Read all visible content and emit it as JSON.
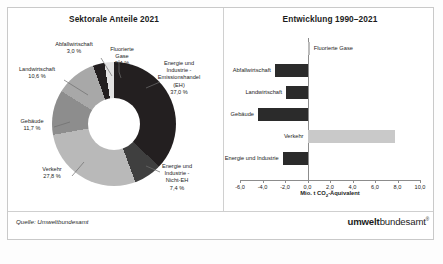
{
  "figure": {
    "source_note": "Quelle: Umweltbundesamt",
    "logo_bold": "umwelt",
    "logo_rest": "bundesamt",
    "logo_mark": "®"
  },
  "left_panel": {
    "title": "Sektorale Anteile 2021",
    "labels": {
      "abfall": "Abfallwirtschaft\n3,0 %",
      "fluor": "Fluorierte\nGase\n2,4 %",
      "eh": "Energie und\nIndustrie -\nEmissionshandel\n(EH)\n37,0 %",
      "nicht_eh": "Energie und\nIndustrie -\nNicht-EH\n7,4 %",
      "verkehr": "Verkehr\n27,8 %",
      "gebaeude": "Gebäude\n11,7 %",
      "landwirtschaft": "Landwirtschaft\n10,6 %"
    }
  },
  "right_panel": {
    "title": "Entwicklung 1990–2021",
    "axis_title_main": "Mio. t CO",
    "axis_title_sub": "2",
    "axis_title_tail": "-Äquivalent"
  },
  "chart_data": [
    {
      "type": "pie",
      "title": "Sektorale Anteile 2021",
      "unit": "%",
      "donut": true,
      "categories": [
        "Energie und Industrie - Emissionshandel (EH)",
        "Energie und Industrie - Nicht-EH",
        "Verkehr",
        "Gebäude",
        "Landwirtschaft",
        "Abfallwirtschaft",
        "Fluorierte Gase"
      ],
      "values": [
        37.0,
        7.4,
        27.8,
        11.7,
        10.6,
        3.0,
        2.4
      ],
      "value_labels": [
        "37,0 %",
        "7,4 %",
        "27,8 %",
        "11,7 %",
        "10,6 %",
        "3,0 %",
        "2,4 %"
      ],
      "colors": [
        "#231f20",
        "#3f3f3f",
        "#b9b9b9",
        "#8d8d8d",
        "#a8a8a8",
        "#231f20",
        "#e2e2e2"
      ],
      "legend": "labels-outside"
    },
    {
      "type": "bar",
      "orientation": "horizontal",
      "title": "Entwicklung 1990–2021",
      "xlabel": "Mio. t CO2-Äquivalent",
      "ylabel": "",
      "xlim": [
        -6.0,
        10.0
      ],
      "xticks": [
        -6.0,
        -4.0,
        -2.0,
        0.0,
        2.0,
        4.0,
        6.0,
        8.0,
        10.0
      ],
      "xtick_labels": [
        "-6,0",
        "-4,0",
        "-2,0",
        "0,0",
        "2,0",
        "4,0",
        "6,0",
        "8,0",
        "10,0"
      ],
      "grid": false,
      "categories": [
        "Fluorierte Gase",
        "Abfallwirtschaft",
        "Landwirtschaft",
        "Gebäude",
        "Verkehr",
        "Energie und Industrie"
      ],
      "values": [
        0.2,
        -2.9,
        -1.9,
        -4.4,
        7.8,
        -2.2
      ],
      "colors": [
        "#bdbdbd",
        "#2b2b2b",
        "#2b2b2b",
        "#2b2b2b",
        "#c9c9c9",
        "#2b2b2b"
      ]
    }
  ]
}
